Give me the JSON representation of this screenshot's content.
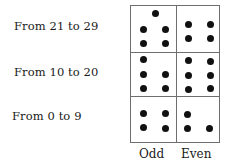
{
  "rows": [
    {
      "label": "From 21 to 29",
      "odd_count": 5,
      "even_count": 4
    },
    {
      "label": "From 10 to 20",
      "odd_count": 5,
      "even_count": 6
    },
    {
      "label": "From 0 to 9",
      "odd_count": 4,
      "even_count": 3
    }
  ],
  "columns": [
    "Odd",
    "Even"
  ],
  "colors": {
    "dot": "#111111",
    "grid_line": "#6e6e6e",
    "text": "#1a1a1a"
  }
}
